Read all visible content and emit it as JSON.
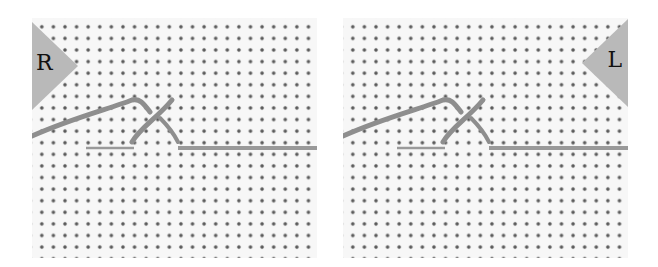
{
  "figure": {
    "panels": [
      {
        "id": "left",
        "label": "R",
        "marker_color": "#b9b9b9"
      },
      {
        "id": "right",
        "label": "L",
        "marker_color": "#b9b9b9"
      }
    ],
    "colors": {
      "fabric": "#f7f7f7",
      "holes": "#5a5a5a",
      "thread": "#8e8e8e",
      "needle": "#9a9a9a"
    }
  }
}
